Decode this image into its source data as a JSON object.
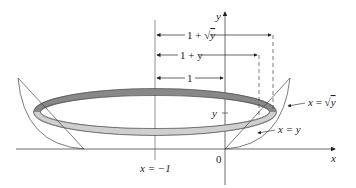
{
  "labels": {
    "y_axis": "y",
    "x_axis": "x",
    "origin": "0",
    "vertical_line": "x = −1",
    "dim_outer": "1 + √y",
    "dim_outer_prefix": "1 + ",
    "dim_outer_var": "y",
    "dim_middle": "1 + y",
    "dim_inner": "1",
    "y_tick": "y",
    "curve_sqrt": "x = √y",
    "curve_sqrt_prefix": "x = ",
    "curve_sqrt_var": "y",
    "curve_linear": "x = y"
  },
  "colors": {
    "ring_dark": "#7a7a7a",
    "ring_light": "#c8c8c8",
    "lines": "#333333"
  }
}
